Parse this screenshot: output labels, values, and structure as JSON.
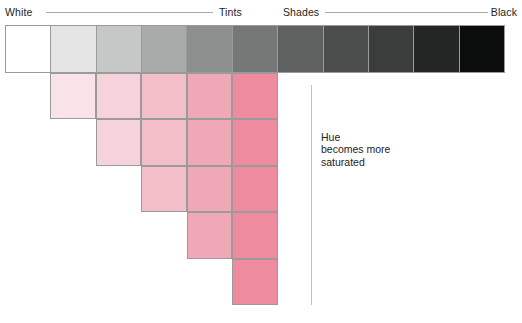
{
  "figure": {
    "background_color": "#ffffff",
    "text_color": "#1d1d1d",
    "rule_color": "#a9a9a9",
    "cell_border_color": "#9b9b9b",
    "divider_color": "#c2c2c2"
  },
  "axis": {
    "white_label": "White",
    "tints_label": "Tints",
    "shades_label": "Shades",
    "black_label": "Black"
  },
  "annotation": {
    "line1": "Hue",
    "line2": "becomes more",
    "line3": "saturated"
  },
  "chart_data": {
    "type": "heatmap",
    "xlabel": "",
    "ylabel": "",
    "grid": true,
    "legend": null,
    "columns": 11,
    "axis_ticks": [
      "White",
      "Tints",
      "Shades",
      "Black"
    ],
    "gray_row": {
      "name": "Value scale (white to black)",
      "values": [
        "#ffffff",
        "#e3e4e3",
        "#c6c8c7",
        "#a9abaa",
        "#8e908f",
        "#767877",
        "#5f6160",
        "#4c4e4d",
        "#3b3d3c",
        "#242625",
        "#0b0c0c"
      ]
    },
    "pink_rows": [
      {
        "row": 1,
        "start_column": 2,
        "end_column": 6,
        "values": [
          "#f8e3e7",
          "#f6d3da",
          "#f2bec8",
          "#efa8b5",
          "#ef8b9e"
        ]
      },
      {
        "row": 2,
        "start_column": 3,
        "end_column": 6,
        "values": [
          "#f6d3da",
          "#f2bec8",
          "#efa8b5",
          "#ef8b9e"
        ]
      },
      {
        "row": 3,
        "start_column": 4,
        "end_column": 6,
        "values": [
          "#f2bec8",
          "#efa8b5",
          "#ef8b9e"
        ]
      },
      {
        "row": 4,
        "start_column": 5,
        "end_column": 6,
        "values": [
          "#efa8b5",
          "#ef8b9e"
        ]
      },
      {
        "row": 5,
        "start_column": 6,
        "end_column": 6,
        "values": [
          "#ef8b9e"
        ]
      }
    ]
  }
}
